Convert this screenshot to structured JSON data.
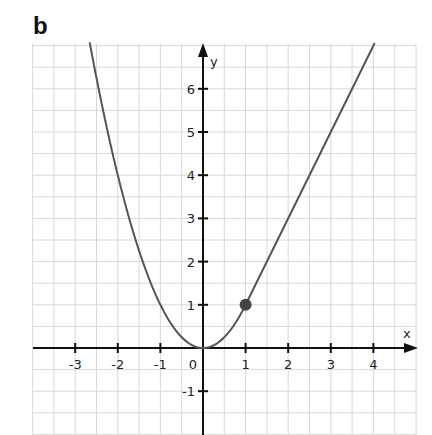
{
  "panel_label": "b",
  "chart_data": {
    "type": "line",
    "title": "",
    "panel": "b",
    "xlabel": "x",
    "ylabel": "y",
    "xlim": [
      -4,
      4.5
    ],
    "ylim": [
      -2,
      7
    ],
    "grid": true,
    "grid_step": 0.5,
    "x_ticks": [
      -3,
      -2,
      -1,
      0,
      1,
      2,
      3,
      4
    ],
    "x_tick_labels": [
      "-3",
      "-2",
      "-1",
      "0",
      "1",
      "2",
      "3",
      "4"
    ],
    "y_ticks": [
      -1,
      1,
      2,
      3,
      4,
      5,
      6
    ],
    "y_tick_labels": [
      "-1",
      "1",
      "2",
      "3",
      "4",
      "5",
      "6"
    ],
    "series": [
      {
        "name": "piecewise f(x)",
        "description": "y = x^2 for x <= 1; y = 2x - 1 for x >= 1",
        "pieces": [
          {
            "formula": "x^2",
            "x_range": [
              -2.66,
              1
            ]
          },
          {
            "formula": "2x-1",
            "x_range": [
              1,
              4.03
            ]
          }
        ],
        "sample_points": [
          {
            "x": -2.5,
            "y": 6.25
          },
          {
            "x": -2,
            "y": 4
          },
          {
            "x": -1,
            "y": 1
          },
          {
            "x": 0,
            "y": 0
          },
          {
            "x": 1,
            "y": 1
          },
          {
            "x": 2,
            "y": 3
          },
          {
            "x": 3,
            "y": 5
          },
          {
            "x": 4,
            "y": 7
          }
        ],
        "color": "#555555"
      }
    ],
    "annotations": [
      {
        "type": "point",
        "x": 1,
        "y": 1,
        "style": "filled-dot",
        "color": "#444444"
      }
    ]
  },
  "colors": {
    "curve": "#555555",
    "axis": "#111111",
    "grid": "#d8d8d8",
    "dot": "#444444"
  }
}
